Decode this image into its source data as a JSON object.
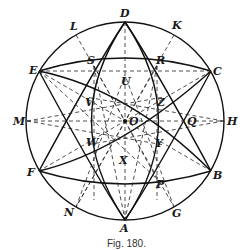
{
  "figure": {
    "caption": "Fig. 180.",
    "center": {
      "label": "O",
      "x": 125,
      "y": 121
    },
    "radius": 99,
    "outer_points": [
      {
        "label": "D",
        "x": 125,
        "y": 22
      },
      {
        "label": "K",
        "x": 174,
        "y": 35
      },
      {
        "label": "C",
        "x": 211,
        "y": 71
      },
      {
        "label": "H",
        "x": 224,
        "y": 121
      },
      {
        "label": "B",
        "x": 211,
        "y": 171
      },
      {
        "label": "G",
        "x": 174,
        "y": 207
      },
      {
        "label": "A",
        "x": 125,
        "y": 220
      },
      {
        "label": "N",
        "x": 76,
        "y": 207
      },
      {
        "label": "F",
        "x": 39,
        "y": 171
      },
      {
        "label": "M",
        "x": 27,
        "y": 121
      },
      {
        "label": "E",
        "x": 39,
        "y": 71
      },
      {
        "label": "L",
        "x": 76,
        "y": 35
      }
    ],
    "inner_points": [
      {
        "label": "S",
        "x": 94,
        "y": 66
      },
      {
        "label": "R",
        "x": 157,
        "y": 66
      },
      {
        "label": "U",
        "x": 125,
        "y": 75
      },
      {
        "label": "V",
        "x": 86,
        "y": 97
      },
      {
        "label": "Z",
        "x": 164,
        "y": 97
      },
      {
        "label": "Q",
        "x": 188,
        "y": 121
      },
      {
        "label": "W",
        "x": 86,
        "y": 145
      },
      {
        "label": "Y",
        "x": 164,
        "y": 145
      },
      {
        "label": "X",
        "x": 125,
        "y": 167
      },
      {
        "label": "P",
        "x": 157,
        "y": 179
      }
    ]
  }
}
